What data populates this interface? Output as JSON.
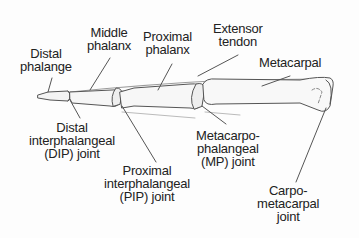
{
  "diagram": {
    "labels": {
      "distal_phalange": "Distal\nphalange",
      "middle_phalanx": "Middle\nphalanx",
      "proximal_phalanx": "Proximal\nphalanx",
      "extensor_tendon": "Extensor\ntendon",
      "metacarpal": "Metacarpal",
      "dip_joint": "Distal\ninterphalangeal\n(DIP) joint",
      "pip_joint": "Proximal\ninterphalangeal\n(PIP) joint",
      "mp_joint": "Metacarpo-\nphalangeal\n(MP) joint",
      "cmc_joint": "Carpo-\nmetacarpal\njoint"
    },
    "colors": {
      "line": "#555555",
      "text": "#222222",
      "tendon": "#9a9a9a",
      "background": "#fdfdfd"
    }
  }
}
